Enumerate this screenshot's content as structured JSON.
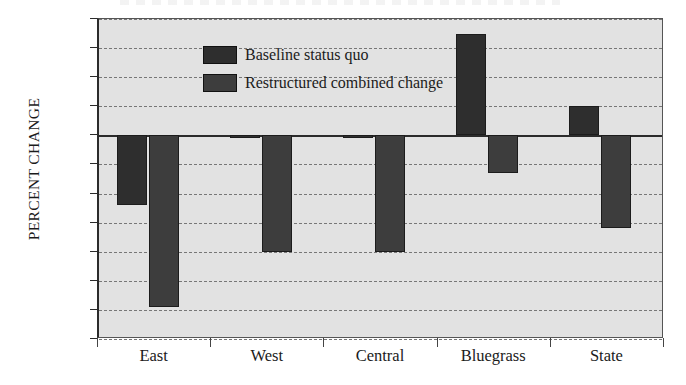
{
  "chart_data": {
    "type": "bar",
    "title": "",
    "xlabel": "",
    "ylabel": "PERCENT CHANGE",
    "categories": [
      "East",
      "West",
      "Central",
      "Bluegrass",
      "State"
    ],
    "series": [
      {
        "name": "Baseline status quo",
        "values": [
          -12,
          -0.5,
          -0.5,
          17.5,
          5
        ],
        "color": "#2e2e2e"
      },
      {
        "name": "Restructured combined change",
        "values": [
          -29.5,
          -20,
          -20,
          -6.5,
          -16
        ],
        "color": "#3d3d3d"
      }
    ],
    "ylim": [
      -35,
      20
    ],
    "ytick_labels": [
      "20",
      "15",
      "10",
      "5",
      "0",
      "-5",
      "-10",
      "-15",
      "-20",
      "-25",
      "-30",
      "-35"
    ],
    "ytick_values": [
      20,
      15,
      10,
      5,
      0,
      -5,
      -10,
      -15,
      -20,
      -25,
      -30,
      -35
    ],
    "grid": true,
    "grid_style": "dashed-horizontal",
    "legend_position": "top-left-inside",
    "plot_background": "#e2e2e2",
    "axis_color": "#2b2b2b"
  }
}
